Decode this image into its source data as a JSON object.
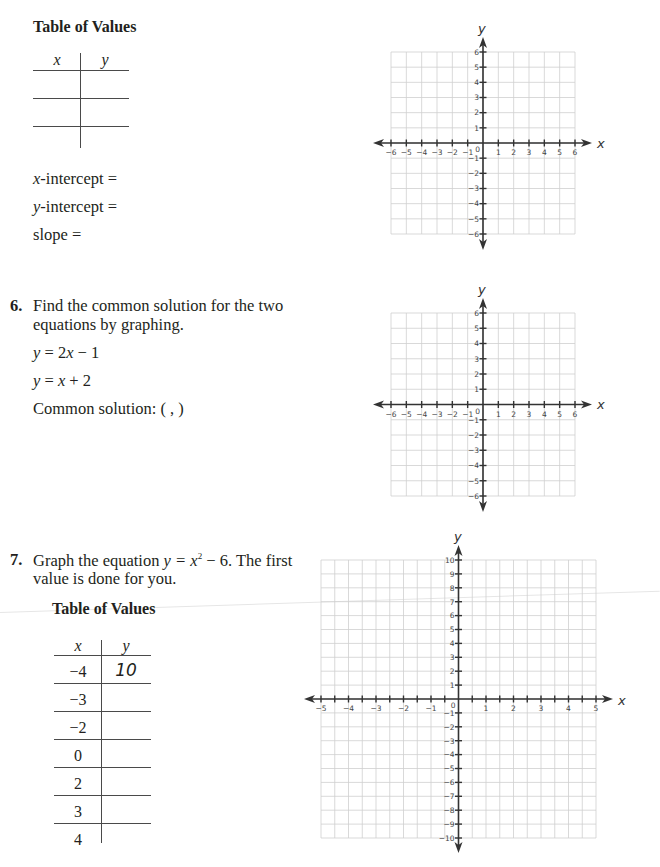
{
  "problem5": {
    "table_title": "Table of Values",
    "headers": {
      "x": "x",
      "y": "y"
    },
    "rows": [
      {
        "x": "",
        "y": ""
      },
      {
        "x": "",
        "y": ""
      },
      {
        "x": "",
        "y": ""
      }
    ],
    "x_intercept_var": "x",
    "x_intercept_label": "-intercept =",
    "y_intercept_var": "y",
    "y_intercept_label": "-intercept =",
    "slope_label": "slope ="
  },
  "problem6": {
    "number": "6.",
    "prompt_line1": "Find the common solution for the two",
    "prompt_line2": "equations by graphing.",
    "eq1": "y = 2x − 1",
    "eq2": "y = x + 2",
    "common_solution_label": "Common solution: (    ,    )"
  },
  "problem7": {
    "number": "7.",
    "prompt_line1_a": "Graph the equation ",
    "prompt_equation": "y = x",
    "prompt_exponent": "2",
    "prompt_line1_b": " − 6. The first",
    "prompt_line2": "value is done for you.",
    "table_title": "Table of Values",
    "headers": {
      "x": "x",
      "y": "y"
    },
    "rows": [
      {
        "x": "−4",
        "y": "10"
      },
      {
        "x": "−3",
        "y": ""
      },
      {
        "x": "−2",
        "y": ""
      },
      {
        "x": "0",
        "y": ""
      },
      {
        "x": "2",
        "y": ""
      },
      {
        "x": "3",
        "y": ""
      },
      {
        "x": "4",
        "y": ""
      }
    ]
  },
  "chart_data": [
    {
      "type": "coordinate-grid",
      "id": "graph1",
      "title": "",
      "xlabel": "x",
      "ylabel": "y",
      "xlim": [
        -6,
        6
      ],
      "ylim": [
        -6,
        6
      ],
      "x_tick_step": 1,
      "y_tick_step": 1,
      "x_tick_labels": [
        "-6",
        "-5",
        "-4",
        "-3",
        "-2",
        "-1",
        "1",
        "2",
        "3",
        "4",
        "5",
        "6"
      ],
      "y_tick_labels": [
        "-6",
        "-5",
        "-4",
        "-3",
        "-2",
        "-1",
        "1",
        "2",
        "3",
        "4",
        "5",
        "6"
      ],
      "origin_label": "0",
      "grid": true,
      "series": [],
      "pixel": {
        "x0": 391,
        "x1": 575,
        "y0": 52,
        "y1": 234,
        "xarrow": [
          373,
          592
        ],
        "yarrow": [
          37,
          250
        ],
        "xlabel_pos": [
          597,
          148
        ],
        "ylabel_pos": [
          478,
          33
        ]
      }
    },
    {
      "type": "coordinate-grid",
      "id": "graph2",
      "title": "",
      "xlabel": "x",
      "ylabel": "y",
      "xlim": [
        -6,
        6
      ],
      "ylim": [
        -6,
        6
      ],
      "x_tick_step": 1,
      "y_tick_step": 1,
      "x_tick_labels": [
        "-6",
        "-5",
        "-4",
        "-3",
        "-2",
        "-1",
        "1",
        "2",
        "3",
        "4",
        "5",
        "6"
      ],
      "y_tick_labels": [
        "-6",
        "-5",
        "-4",
        "-3",
        "-2",
        "-1",
        "1",
        "2",
        "3",
        "4",
        "5",
        "6"
      ],
      "origin_label": "0",
      "grid": true,
      "series": [],
      "pixel": {
        "x0": 391,
        "x1": 575,
        "y0": 313,
        "y1": 496,
        "xarrow": [
          373,
          592
        ],
        "yarrow": [
          298,
          512
        ],
        "xlabel_pos": [
          597,
          409
        ],
        "ylabel_pos": [
          478,
          294
        ]
      }
    },
    {
      "type": "coordinate-grid",
      "id": "graph3",
      "title": "",
      "xlabel": "x",
      "ylabel": "y",
      "xlim": [
        -5,
        5
      ],
      "ylim": [
        -10,
        10
      ],
      "x_tick_step": 0.5,
      "y_tick_step": 1,
      "x_tick_labels": [
        "-5",
        "-4",
        "-3",
        "-2",
        "-1",
        "1",
        "2",
        "3",
        "4",
        "5"
      ],
      "y_tick_labels": [
        "-10",
        "-9",
        "-8",
        "-7",
        "-6",
        "-5",
        "-4",
        "-3",
        "-2",
        "-1",
        "1",
        "2",
        "3",
        "4",
        "5",
        "6",
        "7",
        "8",
        "9",
        "10"
      ],
      "origin_label": "0",
      "grid": true,
      "series": [],
      "pixel": {
        "x0": 321,
        "x1": 596,
        "y0": 560,
        "y1": 838,
        "xarrow": [
          304,
          613
        ],
        "yarrow": [
          545,
          853
        ],
        "xlabel_pos": [
          618,
          705
        ],
        "ylabel_pos": [
          454,
          541
        ]
      }
    }
  ]
}
